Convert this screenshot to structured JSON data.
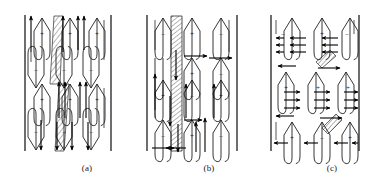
{
  "figure": {
    "background_color": "#ffffff",
    "ink_color": "#1f1f1f",
    "width": 377,
    "height": 190
  },
  "panels": [
    {
      "id": "a",
      "caption": "(a)",
      "left_boundary_x": 24,
      "right_boundary_x": 112,
      "top_y": 14,
      "bottom_y": 152,
      "description": "Teardrop (lancet) domains in alternating rows with a diagonal hatched wall band",
      "polarity_rows": [
        {
          "row": 0,
          "signs": [
            "+",
            "+",
            "+"
          ]
        },
        {
          "row": 1,
          "signs": [
            "-",
            "-",
            "-"
          ]
        },
        {
          "row": 2,
          "signs": [
            "+",
            "+",
            "+"
          ]
        },
        {
          "row": 3,
          "signs": [
            "-",
            "-",
            "-"
          ]
        }
      ],
      "hatch_band": {
        "orientation": "diagonal",
        "x": 58,
        "width": 12
      },
      "arrow_count": 14
    },
    {
      "id": "b",
      "caption": "(b)",
      "left_boundary_x": 146,
      "right_boundary_x": 238,
      "top_y": 14,
      "bottom_y": 152,
      "description": "Lancet domains with a vertical hatched wall band and horizontal closure arrows",
      "polarity_rows": [
        {
          "row": 0,
          "signs": [
            "-",
            "+",
            "-"
          ]
        },
        {
          "row": 1,
          "signs": [
            "+",
            "-",
            "+"
          ]
        },
        {
          "row": 2,
          "signs": [
            "+",
            "-",
            "+"
          ]
        },
        {
          "row": 3,
          "signs": [
            "-",
            "+",
            "-"
          ]
        }
      ],
      "hatch_band": {
        "orientation": "vertical",
        "x": 172,
        "width": 11
      },
      "arrow_count": 16
    },
    {
      "id": "c",
      "caption": "(c)",
      "left_boundary_x": 270,
      "right_boundary_x": 360,
      "top_y": 14,
      "bottom_y": 152,
      "description": "Lancet domains with bundles of horizontal in-plane arrows and a short diagonal hatch",
      "polarity_rows": [
        {
          "row": 0,
          "signs": [
            "-",
            "+",
            "-"
          ]
        },
        {
          "row": 1,
          "signs": [
            "+",
            "+",
            "+"
          ]
        },
        {
          "row": 2,
          "signs": [
            "+",
            "-",
            "+"
          ]
        }
      ],
      "hatch_band": {
        "orientation": "diagonal",
        "x": 320,
        "width": 12
      },
      "arrow_count": 22
    }
  ],
  "symbols": {
    "plus": "+",
    "minus": "–"
  }
}
